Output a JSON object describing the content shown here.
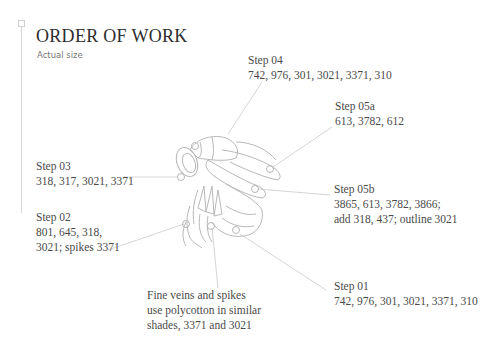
{
  "header": {
    "title": "ORDER OF WORK",
    "subtitle": "Actual size"
  },
  "steps": {
    "step04": {
      "label": "Step 04",
      "lines": [
        "742, 976, 301, 3021, 3371, 310"
      ]
    },
    "step05a": {
      "label": "Step 05a",
      "lines": [
        "613, 3782, 612"
      ]
    },
    "step03": {
      "label": "Step 03",
      "lines": [
        "318, 317, 3021, 3371"
      ]
    },
    "step02": {
      "label": "Step 02",
      "lines": [
        "801, 645, 318,",
        "3021; spikes 3371"
      ]
    },
    "step05b": {
      "label": "Step 05b",
      "lines": [
        "3865, 613, 3782, 3866;",
        "add 318, 437; outline 3021"
      ]
    },
    "step01": {
      "label": "Step 01",
      "lines": [
        "742, 976, 301, 3021, 3371, 310"
      ]
    }
  },
  "note": {
    "lines": [
      "Fine veins and spikes",
      "use polycotton in similar",
      "shades, 3371 and 3021"
    ]
  },
  "colors": {
    "text": "#4a4a4a",
    "title": "#2e2e2e",
    "subtitle": "#777777",
    "leader_line": "#d6d6d6",
    "illustration_stroke": "#b8b8b8"
  }
}
